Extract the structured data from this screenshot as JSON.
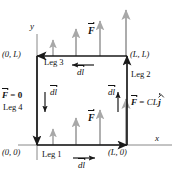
{
  "figure": {
    "axes": {
      "x_label": "x",
      "y_label": "y"
    },
    "corners": [
      {
        "name": "origin",
        "label": "(0, 0)"
      },
      {
        "name": "bottom-right",
        "label": "(L, 0)"
      },
      {
        "name": "top-right",
        "label": "(L, L)"
      },
      {
        "name": "top-left",
        "label": "(0, L)"
      }
    ],
    "legs": [
      {
        "id": "leg1",
        "label": "Leg 1",
        "direction": "right",
        "dl_label": "dl"
      },
      {
        "id": "leg2",
        "label": "Leg 2",
        "direction": "up",
        "dl_label": "dl"
      },
      {
        "id": "leg3",
        "label": "Leg 3",
        "direction": "left",
        "dl_label": "dl"
      },
      {
        "id": "leg4",
        "label": "Leg 4",
        "direction": "down",
        "dl_label": "dl"
      }
    ],
    "force_labels": [
      {
        "id": "f-top",
        "text": "F"
      },
      {
        "id": "f-bottom",
        "text": "F"
      },
      {
        "id": "f-left",
        "F": "F",
        "eq": " = ",
        "value": "0"
      },
      {
        "id": "f-right",
        "F": "F",
        "eq": " = ",
        "value": "CL",
        "unit_vector": "j"
      }
    ],
    "field_arrows": {
      "description": "gray upward arrows, length grows with x",
      "top_row_count": 4,
      "bottom_row_count": 4,
      "color": "#a8a8a8"
    },
    "colors": {
      "path": "#1a1a1a",
      "field": "#a8a8a8",
      "text": "#111111",
      "background": "#ffffff"
    }
  }
}
